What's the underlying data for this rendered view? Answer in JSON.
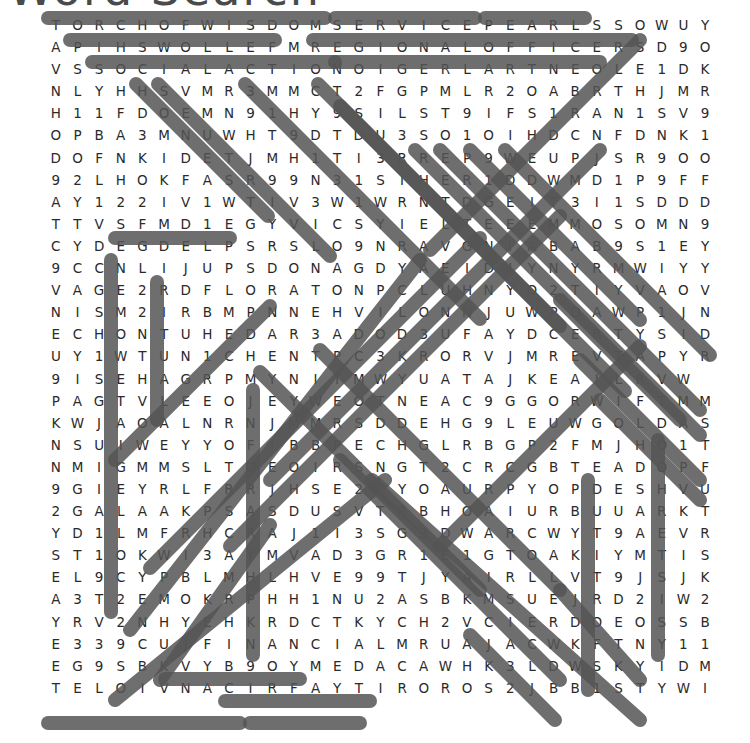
{
  "title": "Word Search",
  "grid": {
    "rows": 32,
    "cols": 32,
    "letters": [
      "TORCHOFWISDOMSERVICEPEARLSSOWUY",
      "APIHSWOLLEFMREGIONALOFFICERSD9O",
      "VSSOCIALACTIONOIGERLARTNEOLE1DK",
      "NLYHHSVMR3MMCT2FGPMLR2OABRTHJMR",
      "H11FDOEMN91HY9SILST9IFS1RAN1SV9",
      "OPBA3MNUWHT9DTDU3SO1OIHDCNFDNK1",
      "DOFNKIDETJMH1TI3RREP9WEUPJSR9OO",
      "92LHOKFASR99N31SIHER1DDWMD1P9FF",
      "AY122IV1WTIV3W1WRNTDGEIT3I1SDDD",
      "TTVSFMD1EGYVICSYIELTEEEMMOSOMN9",
      "CYDEGDELPSRSLO9NRAVGNIABAB9S1EY",
      "9CCNLIJUPSDONAGDYAEIDIYNYRMWIYY",
      "VAGE2RDFLORATONPCLUHNYO2TIYVAOV",
      "NISM2IRBMPNNEHVILONNJUWPOAWP1JN",
      "ECHONTUHEDAR3ADOD3UFAYDCERTYSID",
      "UY1WTUN1CHENTPC3KRORVJMREVTAPYR",
      "9ISEHAGRPMYNITMWYUATAJKEAILRVW",
      "PAGTVLEEOJEYWEOTNEAC9GGORWIFTMM",
      "KWJAOALNRNJMMRSDDEHG9LEUWGOLDAS",
      "NSUIWEYYOFIBBPECHGLRBGP2FMJHO1T",
      "NMIGMMSLTOEOIRSNGT2CRCGBTEADOPF",
      "9GIEYRLFRRJHSE2LYOAURPYOPDESHVU",
      "2GALAAKPSASDUSVTRBHOAIURBUUARKT",
      "YD1LMFRHCRAJ1I3SG3DWARCWYT9AEVR",
      "ST1OKWI3AYMVAD3GR1E1GTOAKIYMTIS",
      "EL9CYPBLMHLHVE99TJYAIRLLVT9JSJK",
      "A3T2EMOKRPHH1NU2ASBKMSUEJRD2IW2",
      "YRV2NHYEHKRDCTKYCH2VCIERDOEOSSB",
      "E339CUJFINANCIALMRUAJACWKFTNY11",
      "EG9SBKVYB9OYMEDACAWHK3LDWSKYIDM",
      "TELOIVNACIRFAYTIROROS2JBB1STYWI"
    ]
  },
  "found_words": [
    "TORCHOFWISDOM",
    "SERVICE",
    "PEARLS",
    "FELLOWSHIP",
    "REGIONALOFFICERS",
    "SOCIALACTION",
    "OENTRALREGION",
    "PLEDGE",
    "FINANCIAL",
    "ACADEMY",
    "AFRICANVIOLET",
    "SORORITY"
  ],
  "colors": {
    "text": "#2a2a2a",
    "loop_outline": "#555555",
    "background": "#ffffff"
  }
}
